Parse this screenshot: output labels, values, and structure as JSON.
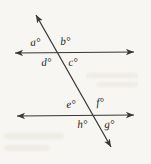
{
  "figure": {
    "background_color": "#f7f6f2",
    "line_color": "#3a3734",
    "label_color": "#2a2724",
    "lines": [
      {
        "name": "top-parallel-line",
        "x1": 9,
        "y1": 53,
        "x2": 140,
        "y2": 52,
        "arrow_start": true,
        "arrow_end": true
      },
      {
        "name": "bottom-parallel-line",
        "x1": 11,
        "y1": 116,
        "x2": 140,
        "y2": 115,
        "arrow_start": true,
        "arrow_end": true
      },
      {
        "name": "transversal-line",
        "x1": 33,
        "y1": 9,
        "x2": 114,
        "y2": 152,
        "arrow_start": true,
        "arrow_end": true
      }
    ],
    "intersections": [
      {
        "name": "top-intersection",
        "x": 55,
        "y": 53
      },
      {
        "name": "bottom-intersection",
        "x": 92,
        "y": 115
      }
    ],
    "angle_labels": [
      {
        "id": "a",
        "text": "a°",
        "x": 30,
        "y": 37,
        "position": "top-left-upper"
      },
      {
        "id": "b",
        "text": "b°",
        "x": 60,
        "y": 36,
        "position": "top-right-upper"
      },
      {
        "id": "d",
        "text": "d°",
        "x": 41,
        "y": 57,
        "position": "top-left-lower"
      },
      {
        "id": "c",
        "text": "c°",
        "x": 68,
        "y": 57,
        "position": "top-right-lower"
      },
      {
        "id": "e",
        "text": "e°",
        "x": 66,
        "y": 99,
        "position": "bottom-left-upper"
      },
      {
        "id": "f",
        "text": "f°",
        "x": 96,
        "y": 97,
        "position": "bottom-right-upper"
      },
      {
        "id": "h",
        "text": "h°",
        "x": 77,
        "y": 119,
        "position": "bottom-left-lower"
      },
      {
        "id": "g",
        "text": "g°",
        "x": 104,
        "y": 119,
        "position": "bottom-right-lower"
      }
    ]
  }
}
